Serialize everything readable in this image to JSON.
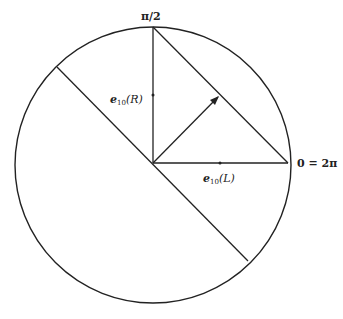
{
  "diagram": {
    "labels": {
      "top": "π/2",
      "right": "0 = 2π",
      "vertical_edge": "e",
      "vertical_edge_sub": "10",
      "vertical_edge_arg": "(R)",
      "horizontal_edge": "e",
      "horizontal_edge_sub": "10",
      "horizontal_edge_arg": "(L)"
    },
    "circle": {
      "cx": 153,
      "cy": 165,
      "r": 138
    },
    "colors": {
      "stroke": "#222222",
      "background": "#ffffff"
    }
  }
}
